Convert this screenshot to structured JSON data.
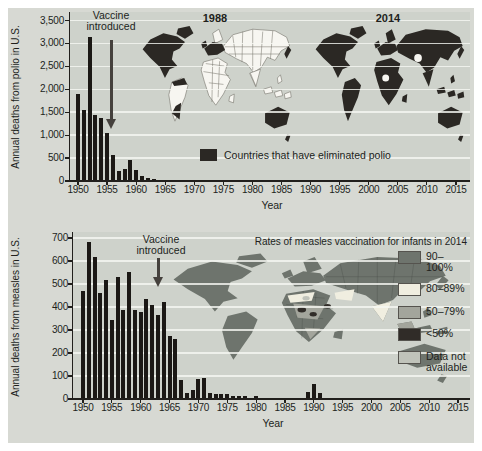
{
  "palette": {
    "panel_bg": "#d7d9d3",
    "plot_bg": "#ced2cb",
    "bar_color": "#1b1815",
    "text_color": "#211f1c",
    "arrow_color": "#45413d",
    "map_dark": "#2b2824",
    "map_white": "#f7f6f1",
    "map_border": "#7a7970"
  },
  "chart_data": [
    {
      "type": "bar",
      "ylabel": "Annual deaths from polio in U.S.",
      "xlabel": "Year",
      "year_start": 1950,
      "year_end": 2015,
      "ylim": [
        0,
        3500
      ],
      "ytick_step": 500,
      "ytick_labels": [
        "0",
        "500",
        "1,000",
        "1,500",
        "2,000",
        "2,500",
        "3,000",
        "3,500"
      ],
      "xtick_labels": [
        "1950",
        "1955",
        "1960",
        "1965",
        "1970",
        "1975",
        "1980",
        "1985",
        "1990",
        "1995",
        "2000",
        "2005",
        "2010",
        "2015"
      ],
      "values": [
        1904,
        1551,
        3145,
        1450,
        1368,
        1043,
        566,
        221,
        255,
        454,
        230,
        100,
        60,
        41,
        17,
        16,
        10,
        8,
        6,
        6,
        7,
        18,
        2,
        10,
        3,
        9,
        16,
        17,
        9,
        26,
        8,
        4,
        2,
        3,
        2,
        2,
        4,
        2,
        0,
        2,
        0,
        1,
        1,
        0,
        0,
        2,
        1,
        2,
        1,
        2,
        1,
        0,
        0,
        0,
        0,
        0,
        0,
        0,
        0,
        0,
        0,
        0,
        0,
        0,
        0,
        0
      ],
      "annotation": {
        "text": "Vaccine introduced",
        "year": 1956
      },
      "maps": [
        {
          "label": "1988"
        },
        {
          "label": "2014"
        }
      ],
      "map_legend": {
        "label": "Countries that have eliminated polio",
        "swatch_color": "#2b2824"
      },
      "grid": true
    },
    {
      "type": "bar",
      "ylabel": "Annual deaths from measles in U.S.",
      "xlabel": "Year",
      "year_start": 1950,
      "year_end": 2015,
      "ylim": [
        0,
        700
      ],
      "ytick_step": 100,
      "ytick_labels": [
        "0",
        "100",
        "200",
        "300",
        "400",
        "500",
        "600",
        "700"
      ],
      "xtick_labels": [
        "1950",
        "1955",
        "1960",
        "1965",
        "1970",
        "1975",
        "1980",
        "1985",
        "1990",
        "1995",
        "2000",
        "2005",
        "2010",
        "2015"
      ],
      "values": [
        468,
        683,
        618,
        462,
        518,
        345,
        530,
        389,
        552,
        385,
        380,
        434,
        408,
        364,
        421,
        276,
        261,
        81,
        24,
        41,
        89,
        90,
        24,
        23,
        20,
        20,
        12,
        15,
        11,
        6,
        11,
        2,
        2,
        4,
        1,
        4,
        2,
        2,
        3,
        32,
        64,
        27,
        4,
        0,
        0,
        1,
        1,
        2,
        0,
        1,
        1,
        1,
        0,
        0,
        1,
        1,
        0,
        0,
        0,
        0,
        2,
        0,
        0,
        0,
        0,
        0
      ],
      "annotation": {
        "text": "Vaccine introduced",
        "year": 1963
      },
      "map_title": "Rates of measles vaccination for infants in 2014",
      "map_legend_entries": [
        {
          "label": "90–100%",
          "color": "#6e746d"
        },
        {
          "label": "80–89%",
          "color": "#f0eee0"
        },
        {
          "label": "50–79%",
          "color": "#a3a59c"
        },
        {
          "label": "<50%",
          "color": "#302c28"
        },
        {
          "label": "Data not available",
          "color": "#c0c3ba"
        }
      ],
      "grid": true
    }
  ]
}
